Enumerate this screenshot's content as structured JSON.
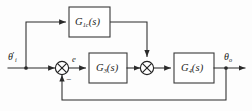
{
  "diagram": {
    "type": "control-system-block-diagram",
    "blocks": [
      {
        "id": "feedforward",
        "symbol": "G",
        "subscript": "1c",
        "argument": "(s)",
        "label": "G1c(s)"
      },
      {
        "id": "forward",
        "symbol": "G",
        "subscript": "3",
        "argument": "(s)",
        "label": "G3(s)"
      },
      {
        "id": "plant",
        "symbol": "G",
        "subscript": "4",
        "argument": "(s)",
        "label": "G4(s)"
      }
    ],
    "signals": {
      "input": {
        "symbol": "θ",
        "prime": "′",
        "subscript": "i",
        "label": "θ′i"
      },
      "error": {
        "symbol": "e",
        "label": "e"
      },
      "output": {
        "symbol": "θ",
        "subscript": "o",
        "label": "θo"
      }
    },
    "summing_junctions": [
      {
        "id": "sum-1",
        "glyph": "cross",
        "signs": [
          "+",
          "−"
        ],
        "negative_sign": "−"
      },
      {
        "id": "sum-2",
        "glyph": "cross",
        "signs": [
          "+",
          "+"
        ]
      }
    ],
    "colors": {
      "wire": "#2a2a2a",
      "block_border": "#3a3a3a",
      "block_fill": "#ffffff",
      "text": "#1c1c1c",
      "background": "#fdfdfd"
    }
  }
}
